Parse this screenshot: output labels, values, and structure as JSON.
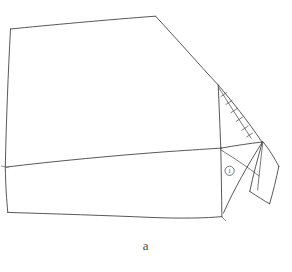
{
  "figure": {
    "caption": "a",
    "kind": "hand-drawn-line-sketch",
    "ink_color": "#3a3a3a",
    "background_color": "#ffffff",
    "annotation": {
      "circled_label": "1",
      "circled_label_title": "circled callout 1",
      "hatch_tick_count": 5,
      "hatch_tick_label": "fold crease hatch marks"
    },
    "parts": [
      {
        "name": "main-panel",
        "label": "large quadrilateral body panel"
      },
      {
        "name": "crease-line",
        "label": "horizontal crease across body"
      },
      {
        "name": "gusset-triangle",
        "label": "narrow hatched triangle"
      },
      {
        "name": "side-flap",
        "label": "hanging quadrilateral flap"
      },
      {
        "name": "lower-fan",
        "label": "lower triangular fan fold"
      }
    ]
  }
}
